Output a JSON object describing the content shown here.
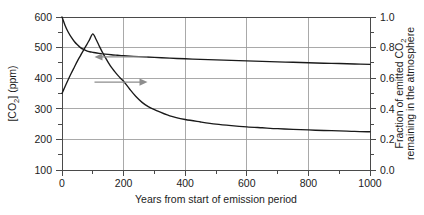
{
  "chart_data": {
    "type": "line",
    "title": "",
    "subtitle": "",
    "xlabel": "Years from start of emission period",
    "ylabel": "[CO2] (ppm)",
    "ylabel_text": "[CO",
    "ylabel_sub": "2",
    "ylabel_tail": "] (ppm)",
    "y2label_line1_a": "Fraction of emitted CO",
    "y2label_line1_sub": "2",
    "y2label_line2": "remaining in the atmosphere",
    "xlim": [
      0,
      1000
    ],
    "ylim": [
      100,
      600
    ],
    "y2lim": [
      0.0,
      1.0
    ],
    "grid": true,
    "grid_axes": "both",
    "legend": "none",
    "xticks": [
      0,
      200,
      400,
      600,
      800,
      1000
    ],
    "xtick_labels": [
      "0",
      "200",
      "400",
      "600",
      "800",
      "1000"
    ],
    "xminor_ticks": [
      100,
      300,
      500,
      700,
      900
    ],
    "yticks": [
      100,
      200,
      300,
      400,
      500,
      600
    ],
    "ytick_labels": [
      "100",
      "200",
      "300",
      "400",
      "500",
      "600"
    ],
    "yminor_ticks": [
      150,
      250,
      350,
      450,
      550
    ],
    "y2ticks": [
      0.0,
      0.2,
      0.4,
      0.6,
      0.8,
      1.0
    ],
    "y2tick_labels": [
      "0.0",
      "0.2",
      "0.4",
      "0.6",
      "0.8",
      "1.0"
    ],
    "y2minor_ticks": [
      0.1,
      0.3,
      0.5,
      0.7,
      0.9
    ],
    "series": [
      {
        "name": "CO2 concentration",
        "axis": "left",
        "units": "ppm",
        "x": [
          0,
          10,
          20,
          30,
          40,
          50,
          60,
          70,
          80,
          90,
          100,
          110,
          120,
          130,
          140,
          150,
          160,
          170,
          180,
          190,
          200,
          220,
          240,
          260,
          280,
          300,
          350,
          400,
          450,
          500,
          550,
          600,
          650,
          700,
          750,
          800,
          850,
          900,
          950,
          1000
        ],
        "values": [
          350,
          373,
          395,
          416,
          436,
          456,
          474,
          492,
          509,
          527,
          545,
          528,
          507,
          487,
          469,
          452,
          436,
          423,
          411,
          400,
          390,
          364,
          340,
          321,
          307,
          297,
          277,
          265,
          257,
          250,
          245,
          241,
          238,
          235,
          233,
          231,
          229,
          228,
          226,
          225
        ]
      },
      {
        "name": "Fraction of emitted CO2 remaining in the atmosphere",
        "axis": "right",
        "units": "fraction",
        "x": [
          0,
          10,
          20,
          30,
          40,
          50,
          60,
          70,
          80,
          90,
          100,
          120,
          140,
          160,
          180,
          200,
          250,
          300,
          350,
          400,
          450,
          500,
          550,
          600,
          650,
          700,
          750,
          800,
          850,
          900,
          950,
          1000
        ],
        "values": [
          1.0,
          0.945,
          0.902,
          0.868,
          0.84,
          0.818,
          0.8,
          0.788,
          0.779,
          0.773,
          0.769,
          0.762,
          0.757,
          0.753,
          0.75,
          0.747,
          0.741,
          0.736,
          0.731,
          0.727,
          0.723,
          0.72,
          0.716,
          0.713,
          0.71,
          0.707,
          0.704,
          0.701,
          0.698,
          0.696,
          0.693,
          0.69
        ]
      }
    ],
    "annotations": [
      {
        "name": "left-axis-pointer",
        "icon": "arrow-left-icon",
        "points_to": "left",
        "describes": "CO2 concentration curve reads left axis",
        "x_from": 155,
        "x_to": 95,
        "y_value": 452
      },
      {
        "name": "right-axis-pointer",
        "icon": "arrow-right-icon",
        "points_to": "right",
        "describes": "Fraction remaining curve reads right axis",
        "x_from": 95,
        "x_to": 160,
        "y_value": 370
      }
    ],
    "colors": {
      "curve": "#1a1a1a",
      "grid": "#9a9a9a",
      "frame": "#4a4a4a",
      "pointer": "#8d8d8d",
      "background": "#ffffff",
      "text": "#1c1c1c"
    }
  }
}
